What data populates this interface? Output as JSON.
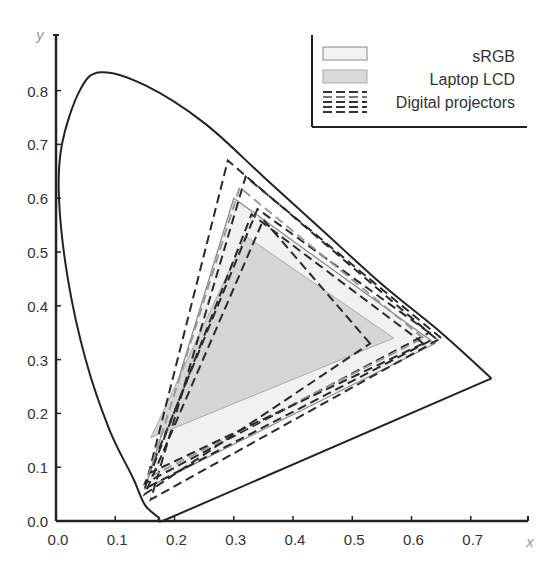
{
  "chart_data": {
    "type": "scatter",
    "title": "",
    "xlabel": "x",
    "ylabel": "y",
    "xlim": [
      0.0,
      0.8
    ],
    "ylim": [
      0.0,
      0.85
    ],
    "x_ticks": [
      "0.0",
      "0.1",
      "0.2",
      "0.3",
      "0.4",
      "0.5",
      "0.6",
      "0.7"
    ],
    "y_ticks": [
      "0.0",
      "0.1",
      "0.2",
      "0.3",
      "0.4",
      "0.5",
      "0.6",
      "0.7",
      "0.8"
    ],
    "grid": false,
    "legend_position": "top-right",
    "legend": [
      "sRGB",
      "Laptop LCD",
      "Digital projectors"
    ],
    "spectral_locus": [
      [
        0.175,
        0.005
      ],
      [
        0.15,
        0.03
      ],
      [
        0.13,
        0.08
      ],
      [
        0.09,
        0.17
      ],
      [
        0.05,
        0.3
      ],
      [
        0.02,
        0.45
      ],
      [
        0.005,
        0.6
      ],
      [
        0.01,
        0.7
      ],
      [
        0.04,
        0.8
      ],
      [
        0.075,
        0.834
      ],
      [
        0.15,
        0.81
      ],
      [
        0.25,
        0.74
      ],
      [
        0.35,
        0.64
      ],
      [
        0.45,
        0.54
      ],
      [
        0.55,
        0.44
      ],
      [
        0.65,
        0.35
      ],
      [
        0.735,
        0.265
      ]
    ],
    "series": [
      {
        "name": "sRGB",
        "style": "filled-light",
        "vertices": [
          [
            0.64,
            0.33
          ],
          [
            0.3,
            0.6
          ],
          [
            0.15,
            0.06
          ]
        ]
      },
      {
        "name": "Laptop LCD",
        "style": "filled-gray",
        "vertices": [
          [
            0.57,
            0.34
          ],
          [
            0.32,
            0.53
          ],
          [
            0.16,
            0.155
          ]
        ]
      },
      {
        "name": "Digital projector 1",
        "style": "dashed",
        "vertices": [
          [
            0.64,
            0.34
          ],
          [
            0.29,
            0.67
          ],
          [
            0.15,
            0.06
          ]
        ]
      },
      {
        "name": "Digital projector 2",
        "style": "dashed",
        "vertices": [
          [
            0.65,
            0.34
          ],
          [
            0.32,
            0.64
          ],
          [
            0.16,
            0.04
          ]
        ]
      },
      {
        "name": "Digital projector 3",
        "style": "dashed",
        "vertices": [
          [
            0.63,
            0.35
          ],
          [
            0.34,
            0.58
          ],
          [
            0.15,
            0.07
          ]
        ]
      },
      {
        "name": "Digital projector 4",
        "style": "dashed-gray",
        "vertices": [
          [
            0.62,
            0.34
          ],
          [
            0.31,
            0.62
          ],
          [
            0.155,
            0.08
          ]
        ]
      },
      {
        "name": "Digital projector 5",
        "style": "dashed",
        "vertices": [
          [
            0.62,
            0.33
          ],
          [
            0.33,
            0.57
          ],
          [
            0.16,
            0.09
          ]
        ]
      },
      {
        "name": "Digital projector 6",
        "style": "dashed",
        "vertices": [
          [
            0.53,
            0.33
          ],
          [
            0.35,
            0.56
          ],
          [
            0.15,
            0.05
          ]
        ]
      }
    ]
  }
}
